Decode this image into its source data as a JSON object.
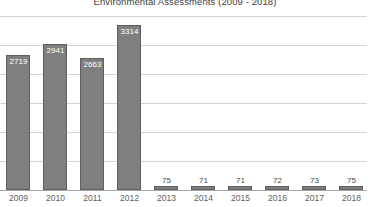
{
  "chart_data": {
    "type": "bar",
    "title": "Environmental Assessments (2009 - 2018)",
    "xlabel": "",
    "ylabel": "",
    "categories": [
      "2009",
      "2010",
      "2011",
      "2012",
      "2013",
      "2014",
      "2015",
      "2016",
      "2017",
      "2018"
    ],
    "values": [
      2719,
      2941,
      2663,
      3314,
      75,
      71,
      71,
      72,
      73,
      75
    ],
    "data_labels": [
      "2719",
      "2941",
      "2663",
      "3314",
      "75",
      "71",
      "71",
      "72",
      "73",
      "75"
    ],
    "series": [
      {
        "name": "Environmental Assessments",
        "values": [
          2719,
          2941,
          2663,
          3314,
          75,
          71,
          71,
          72,
          73,
          75
        ]
      }
    ],
    "ylim": [
      0,
      3500
    ],
    "y_tick_interval": 500,
    "y_ticks_visible": false,
    "gridlines": {
      "horizontal": true,
      "vertical": false,
      "count": 7,
      "color": "#d4d4d4"
    },
    "legend": {
      "visible": false,
      "position": "none"
    },
    "colors": {
      "bar_fill": "#7f7f7f",
      "bar_border": "#5e5e5e",
      "gridline": "#d4d4d4",
      "axis_line": "#a6a6a6",
      "title_text": "#404040",
      "axis_label_text": "#5e5e5e",
      "data_label_inside": "#ffffff",
      "data_label_outside": "#4a4a4a",
      "background": "#ffffff"
    }
  }
}
